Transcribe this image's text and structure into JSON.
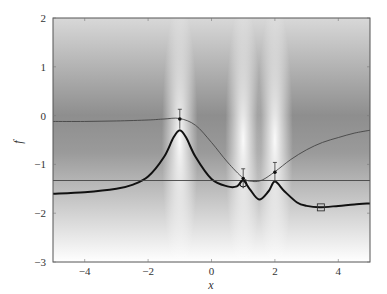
{
  "chart_data": {
    "type": "line",
    "title": "",
    "xlabel": "x",
    "ylabel": "f",
    "xlim": [
      -5,
      5
    ],
    "ylim": [
      -3,
      2
    ],
    "xticks": [
      -4,
      -2,
      0,
      2,
      4
    ],
    "yticks": [
      -3,
      -2,
      -1,
      0,
      1,
      2
    ],
    "grid": false,
    "legend": "none",
    "series": [
      {
        "name": "posterior mean",
        "style": "thin",
        "color": "#444444",
        "x": [
          -5,
          -4,
          -3,
          -2,
          -1.5,
          -1,
          -0.5,
          0,
          0.5,
          1,
          1.3,
          1.6,
          2,
          2.5,
          3,
          3.5,
          4,
          4.5,
          5
        ],
        "y": [
          -0.12,
          -0.12,
          -0.11,
          -0.09,
          -0.07,
          -0.06,
          -0.2,
          -0.55,
          -0.95,
          -1.28,
          -1.35,
          -1.32,
          -1.15,
          -0.9,
          -0.7,
          -0.55,
          -0.45,
          -0.36,
          -0.3
        ]
      },
      {
        "name": "acquisition",
        "style": "thick",
        "color": "#111111",
        "x": [
          -5,
          -4,
          -3,
          -2.5,
          -2,
          -1.5,
          -1.2,
          -1,
          -0.8,
          -0.5,
          0,
          0.5,
          0.8,
          1,
          1.2,
          1.5,
          1.8,
          2,
          2.3,
          2.7,
          3,
          3.4,
          4,
          4.5,
          5
        ],
        "y": [
          -1.6,
          -1.57,
          -1.5,
          -1.42,
          -1.25,
          -0.85,
          -0.45,
          -0.3,
          -0.45,
          -0.85,
          -1.3,
          -1.45,
          -1.45,
          -1.33,
          -1.5,
          -1.72,
          -1.55,
          -1.35,
          -1.55,
          -1.78,
          -1.85,
          -1.88,
          -1.85,
          -1.82,
          -1.8
        ]
      },
      {
        "name": "best observed",
        "style": "horizontal",
        "color": "#444444",
        "x": [
          -5,
          5
        ],
        "y": [
          -1.33,
          -1.33
        ]
      }
    ],
    "observations": [
      {
        "x": -1,
        "y": -0.07,
        "err": 0.2
      },
      {
        "x": 1,
        "y": -1.29,
        "err": 0.2
      },
      {
        "x": 2,
        "y": -1.16,
        "err": 0.2
      }
    ],
    "best_point": {
      "x": 1,
      "y": -1.33
    },
    "next_point": {
      "x": 3.45,
      "y": -1.88
    },
    "uncertainty_centers": [
      -1,
      1,
      2
    ]
  }
}
